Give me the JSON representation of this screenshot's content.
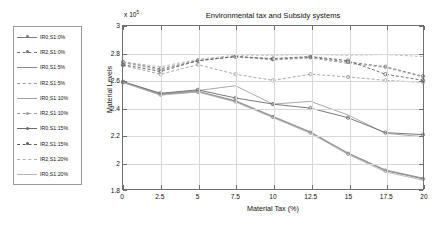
{
  "chart_data": {
    "type": "line",
    "title": "Environmental tax and Subsidy systems",
    "xlabel": "Material Tax (%)",
    "ylabel": "Material Levels",
    "y_multiplier": "x 10",
    "y_multiplier_exp": "5",
    "xlim": [
      0,
      20
    ],
    "ylim": [
      1.8,
      3.0
    ],
    "xticks": [
      "0",
      "2.5",
      "5",
      "7.5",
      "10",
      "12.5",
      "15",
      "17.5",
      "20"
    ],
    "yticks": [
      "1.8",
      "2",
      "2.2",
      "2.4",
      "2.6",
      "2.8",
      "3"
    ],
    "grid": true,
    "legend_position": "outside-left",
    "x": [
      0,
      2.5,
      5,
      7.5,
      10,
      12.5,
      15,
      17.5,
      20
    ],
    "series": [
      {
        "name": "IR0,S1:0%",
        "style": "solid",
        "marker": "dot",
        "color": "#7a7a7a",
        "values": [
          2.585,
          2.495,
          2.515,
          2.445,
          2.33,
          2.215,
          2.06,
          1.935,
          1.875
        ]
      },
      {
        "name": "IR2,S1:0%",
        "style": "dashed",
        "marker": "dot",
        "color": "#707070",
        "values": [
          2.735,
          2.685,
          2.745,
          2.775,
          2.755,
          2.77,
          2.735,
          2.7,
          2.63
        ]
      },
      {
        "name": "IR0,S1:5%",
        "style": "solid",
        "marker": "none",
        "color": "#8a8a8a",
        "values": [
          2.585,
          2.5,
          2.52,
          2.45,
          2.335,
          2.22,
          2.065,
          1.94,
          1.88
        ]
      },
      {
        "name": "IR2,S1:5%",
        "style": "dashed",
        "marker": "none",
        "color": "#9a9a9a",
        "values": [
          2.73,
          2.675,
          2.745,
          2.775,
          2.75,
          2.765,
          2.725,
          2.695,
          2.625
        ]
      },
      {
        "name": "IR0,S1:10%",
        "style": "solid",
        "marker": "none",
        "color": "#a0a0a0",
        "values": [
          2.59,
          2.5,
          2.525,
          2.56,
          2.425,
          2.445,
          2.345,
          2.21,
          2.185
        ]
      },
      {
        "name": "IR2,S1:10%",
        "style": "dashed",
        "marker": "dot",
        "color": "#9e9e9e",
        "values": [
          2.71,
          2.645,
          2.715,
          2.645,
          2.6,
          2.645,
          2.625,
          2.6,
          2.585
        ]
      },
      {
        "name": "IR0,S1:15%",
        "style": "solid",
        "marker": "dot",
        "color": "#6b6b6b",
        "values": [
          2.59,
          2.505,
          2.53,
          2.47,
          2.425,
          2.395,
          2.325,
          2.215,
          2.2
        ]
      },
      {
        "name": "IR2,S1:15%",
        "style": "dashed",
        "marker": "dot",
        "color": "#5f5f5f",
        "values": [
          2.715,
          2.665,
          2.745,
          2.775,
          2.76,
          2.775,
          2.745,
          2.645,
          2.6
        ]
      },
      {
        "name": "IR2,S1:20%",
        "style": "dashed",
        "marker": "none",
        "color": "#b0b0b0",
        "values": [
          2.735,
          2.7,
          2.755,
          2.785,
          2.785,
          2.79,
          2.785,
          2.79,
          2.775
        ]
      },
      {
        "name": "IR0,S1:20%",
        "style": "solid",
        "marker": "none",
        "color": "#b5b5b5",
        "values": [
          2.585,
          2.49,
          2.515,
          2.44,
          2.325,
          2.21,
          2.055,
          1.925,
          1.865
        ]
      }
    ]
  },
  "legend": {
    "items": [
      {
        "label": "IR0,S1:0%"
      },
      {
        "label": "IR2,S1:0%"
      },
      {
        "label": "IR0,S1:5%"
      },
      {
        "label": "IR2,S1:5%"
      },
      {
        "label": "IR0,S1:10%"
      },
      {
        "label": "IR2,S1:10%"
      },
      {
        "label": "IR0,S1:15%"
      },
      {
        "label": "IR2,S1:15%"
      },
      {
        "label": "IR2,S1:20%"
      },
      {
        "label": "IR0,S1:20%"
      }
    ]
  }
}
